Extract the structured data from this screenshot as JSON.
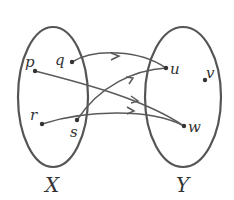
{
  "diagram": {
    "type": "function-mapping",
    "sets": [
      {
        "id": "X",
        "label": "X",
        "elements": [
          "p",
          "q",
          "r",
          "s"
        ]
      },
      {
        "id": "Y",
        "label": "Y",
        "elements": [
          "u",
          "v",
          "w"
        ]
      }
    ],
    "elements": {
      "p": {
        "label": "p"
      },
      "q": {
        "label": "q"
      },
      "r": {
        "label": "r"
      },
      "s": {
        "label": "s"
      },
      "u": {
        "label": "u"
      },
      "v": {
        "label": "v"
      },
      "w": {
        "label": "w"
      }
    },
    "mappings": [
      {
        "from": "q",
        "to": "u"
      },
      {
        "from": "s",
        "to": "u"
      },
      {
        "from": "p",
        "to": "w"
      },
      {
        "from": "r",
        "to": "w"
      }
    ],
    "colors": {
      "stroke": "#555555",
      "text": "#333333",
      "background": "#ffffff"
    }
  }
}
